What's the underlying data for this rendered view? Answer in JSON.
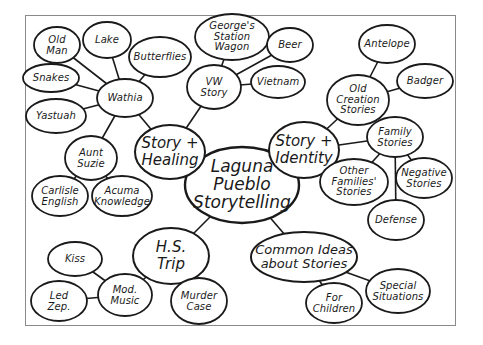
{
  "diagram": {
    "type": "mind-map",
    "title": "Laguna Pueblo Storytelling",
    "frame": {
      "x": 25,
      "y": 15,
      "w": 431,
      "h": 311,
      "border_color": "#8a8a8a"
    },
    "colors": {
      "stroke": "#1a1a1a",
      "fill": "#ffffff",
      "background": "#ffffff"
    },
    "nodes": [
      {
        "id": "center",
        "label": "Laguna\nPueblo\nStorytelling",
        "cx": 242,
        "cy": 185,
        "rx": 57,
        "ry": 38,
        "level": "center"
      },
      {
        "id": "story-healing",
        "label": "Story +\nHealing",
        "cx": 170,
        "cy": 152,
        "rx": 35,
        "ry": 27,
        "level": "major"
      },
      {
        "id": "story-identity",
        "label": "Story +\nIdentity",
        "cx": 304,
        "cy": 150,
        "rx": 35,
        "ry": 28,
        "level": "major"
      },
      {
        "id": "hs-trip",
        "label": "H.S.\nTrip",
        "cx": 171,
        "cy": 256,
        "rx": 38,
        "ry": 28,
        "level": "major"
      },
      {
        "id": "common-ideas",
        "label": "Common Ideas\nabout Stories",
        "cx": 304,
        "cy": 257,
        "rx": 53,
        "ry": 25,
        "level": "mid"
      },
      {
        "id": "wathia",
        "label": "Wathia",
        "cx": 125,
        "cy": 98,
        "rx": 28,
        "ry": 19,
        "level": "minor"
      },
      {
        "id": "old-man",
        "label": "Old\nMan",
        "cx": 57,
        "cy": 45,
        "rx": 23,
        "ry": 18,
        "level": "minor"
      },
      {
        "id": "lake",
        "label": "Lake",
        "cx": 107,
        "cy": 40,
        "rx": 24,
        "ry": 18,
        "level": "minor"
      },
      {
        "id": "butterflies",
        "label": "Butterflies",
        "cx": 160,
        "cy": 57,
        "rx": 31,
        "ry": 20,
        "level": "minor"
      },
      {
        "id": "snakes",
        "label": "Snakes",
        "cx": 51,
        "cy": 78,
        "rx": 28,
        "ry": 14,
        "level": "minor"
      },
      {
        "id": "yastuah",
        "label": "Yastuah",
        "cx": 56,
        "cy": 116,
        "rx": 30,
        "ry": 17,
        "level": "minor"
      },
      {
        "id": "aunt-suzie",
        "label": "Aunt\nSuzie",
        "cx": 91,
        "cy": 158,
        "rx": 26,
        "ry": 22,
        "level": "minor"
      },
      {
        "id": "carlisle-english",
        "label": "Carlisle\nEnglish",
        "cx": 60,
        "cy": 196,
        "rx": 28,
        "ry": 20,
        "level": "minor"
      },
      {
        "id": "acuma-knowledge",
        "label": "Acuma\nKnowledge",
        "cx": 122,
        "cy": 196,
        "rx": 30,
        "ry": 20,
        "level": "minor"
      },
      {
        "id": "vw-story",
        "label": "VW\nStory",
        "cx": 214,
        "cy": 87,
        "rx": 27,
        "ry": 22,
        "level": "minor"
      },
      {
        "id": "georges-wagon",
        "label": "George's\nStation\nWagon",
        "cx": 232,
        "cy": 37,
        "rx": 37,
        "ry": 23,
        "level": "minor"
      },
      {
        "id": "beer",
        "label": "Beer",
        "cx": 290,
        "cy": 45,
        "rx": 23,
        "ry": 17,
        "level": "minor"
      },
      {
        "id": "vietnam",
        "label": "Vietnam",
        "cx": 278,
        "cy": 82,
        "rx": 27,
        "ry": 16,
        "level": "minor"
      },
      {
        "id": "old-creation",
        "label": "Old\nCreation\nStories",
        "cx": 358,
        "cy": 100,
        "rx": 31,
        "ry": 25,
        "level": "minor"
      },
      {
        "id": "antelope",
        "label": "Antelope",
        "cx": 387,
        "cy": 44,
        "rx": 28,
        "ry": 19,
        "level": "minor"
      },
      {
        "id": "badger",
        "label": "Badger",
        "cx": 425,
        "cy": 81,
        "rx": 28,
        "ry": 17,
        "level": "minor"
      },
      {
        "id": "family-stories",
        "label": "Family\nStories",
        "cx": 395,
        "cy": 137,
        "rx": 28,
        "ry": 20,
        "level": "minor"
      },
      {
        "id": "other-families",
        "label": "Other\nFamilies'\nStories",
        "cx": 354,
        "cy": 182,
        "rx": 34,
        "ry": 23,
        "level": "minor"
      },
      {
        "id": "negative-stories",
        "label": "Negative\nStories",
        "cx": 424,
        "cy": 178,
        "rx": 28,
        "ry": 20,
        "level": "minor"
      },
      {
        "id": "defense",
        "label": "Defense",
        "cx": 396,
        "cy": 220,
        "rx": 28,
        "ry": 20,
        "level": "minor"
      },
      {
        "id": "kiss",
        "label": "Kiss",
        "cx": 75,
        "cy": 259,
        "rx": 27,
        "ry": 17,
        "level": "minor"
      },
      {
        "id": "mod-music",
        "label": "Mod.\nMusic",
        "cx": 125,
        "cy": 295,
        "rx": 27,
        "ry": 21,
        "level": "minor"
      },
      {
        "id": "led-zep",
        "label": "Led\nZep.",
        "cx": 59,
        "cy": 301,
        "rx": 28,
        "ry": 20,
        "level": "minor"
      },
      {
        "id": "murder-case",
        "label": "Murder\nCase",
        "cx": 199,
        "cy": 301,
        "rx": 28,
        "ry": 23,
        "level": "minor"
      },
      {
        "id": "for-children",
        "label": "For\nChildren",
        "cx": 334,
        "cy": 303,
        "rx": 28,
        "ry": 20,
        "level": "minor"
      },
      {
        "id": "special-situations",
        "label": "Special\nSituations",
        "cx": 398,
        "cy": 291,
        "rx": 32,
        "ry": 22,
        "level": "minor"
      }
    ],
    "edges": [
      [
        "center",
        "story-healing"
      ],
      [
        "center",
        "story-identity"
      ],
      [
        "center",
        "hs-trip"
      ],
      [
        "center",
        "common-ideas"
      ],
      [
        "story-healing",
        "wathia"
      ],
      [
        "story-healing",
        "vw-story"
      ],
      [
        "wathia",
        "old-man"
      ],
      [
        "wathia",
        "lake"
      ],
      [
        "wathia",
        "butterflies"
      ],
      [
        "wathia",
        "snakes"
      ],
      [
        "wathia",
        "yastuah"
      ],
      [
        "wathia",
        "aunt-suzie"
      ],
      [
        "aunt-suzie",
        "carlisle-english"
      ],
      [
        "aunt-suzie",
        "acuma-knowledge"
      ],
      [
        "vw-story",
        "georges-wagon"
      ],
      [
        "vw-story",
        "beer"
      ],
      [
        "vw-story",
        "vietnam"
      ],
      [
        "story-identity",
        "old-creation"
      ],
      [
        "story-identity",
        "family-stories"
      ],
      [
        "old-creation",
        "antelope"
      ],
      [
        "old-creation",
        "badger"
      ],
      [
        "family-stories",
        "other-families"
      ],
      [
        "family-stories",
        "negative-stories"
      ],
      [
        "family-stories",
        "defense"
      ],
      [
        "hs-trip",
        "mod-music"
      ],
      [
        "hs-trip",
        "murder-case"
      ],
      [
        "mod-music",
        "kiss"
      ],
      [
        "mod-music",
        "led-zep"
      ],
      [
        "common-ideas",
        "for-children"
      ],
      [
        "common-ideas",
        "special-situations"
      ]
    ]
  }
}
